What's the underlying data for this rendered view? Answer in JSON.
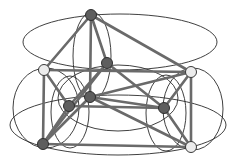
{
  "diagram": {
    "type": "graph-embedding",
    "colors": {
      "edge": "#6a6a6a",
      "curve": "#2a2a2a",
      "dark_node": "#5e5e5e",
      "light_node": "#ececec",
      "background": "#ffffff"
    },
    "nodes": [
      {
        "id": "A",
        "shade": "dark"
      },
      {
        "id": "B",
        "shade": "light"
      },
      {
        "id": "C",
        "shade": "dark"
      },
      {
        "id": "D",
        "shade": "light"
      },
      {
        "id": "E",
        "shade": "dark"
      },
      {
        "id": "F",
        "shade": "dark"
      },
      {
        "id": "G",
        "shade": "dark"
      },
      {
        "id": "H",
        "shade": "dark"
      },
      {
        "id": "I",
        "shade": "light"
      }
    ],
    "edges": [
      [
        "A",
        "B"
      ],
      [
        "A",
        "C"
      ],
      [
        "A",
        "F"
      ],
      [
        "A",
        "D"
      ],
      [
        "B",
        "D"
      ],
      [
        "B",
        "H"
      ],
      [
        "B",
        "E"
      ],
      [
        "C",
        "E"
      ],
      [
        "C",
        "H"
      ],
      [
        "C",
        "G"
      ],
      [
        "D",
        "G"
      ],
      [
        "D",
        "I"
      ],
      [
        "D",
        "F"
      ],
      [
        "E",
        "G"
      ],
      [
        "F",
        "I"
      ],
      [
        "H",
        "I"
      ],
      [
        "G",
        "I"
      ],
      [
        "H",
        "E"
      ],
      [
        "H",
        "F"
      ],
      [
        "F",
        "G"
      ]
    ]
  }
}
